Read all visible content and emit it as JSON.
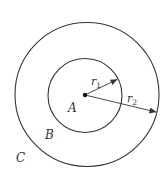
{
  "diagram": {
    "type": "concentric-circles",
    "colors": {
      "stroke": "#333333",
      "background": "#ffffff"
    },
    "outer_circle": {
      "cx": 87,
      "cy": 94.5,
      "r": 72
    },
    "inner_circle": {
      "cx": 85,
      "cy": 95.5,
      "r": 37
    },
    "center_point": {
      "x": 85,
      "y": 95
    },
    "regions": {
      "inner": "A",
      "ring": "B",
      "outside": "C"
    },
    "radii": [
      {
        "base": "r",
        "sub": "1",
        "target": "inner-circle"
      },
      {
        "base": "r",
        "sub": "2",
        "target": "outer-circle"
      }
    ]
  }
}
